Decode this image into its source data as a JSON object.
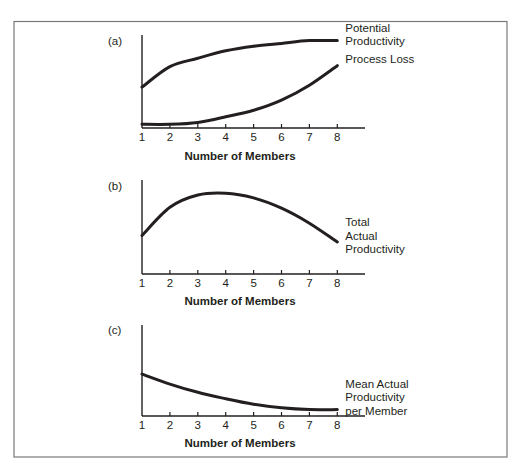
{
  "figure": {
    "frame_color": "#7a7a7a",
    "line_color": "#231f20",
    "background": "#ffffff"
  },
  "chart_data": [
    {
      "type": "line",
      "panel": "(a)",
      "title": "",
      "xlabel": "Number of Members",
      "ylabel": "",
      "x": [
        1,
        2,
        3,
        4,
        5,
        6,
        7,
        8
      ],
      "xticks": [
        "1",
        "2",
        "3",
        "4",
        "5",
        "6",
        "7",
        "8"
      ],
      "ylim": [
        0,
        100
      ],
      "grid": false,
      "legend_position": "inline-right",
      "series": [
        {
          "name": "Potential Productivity",
          "label_lines": [
            "Potential",
            "Productivity"
          ],
          "values": [
            44,
            66,
            75,
            83,
            88,
            91,
            94,
            94
          ]
        },
        {
          "name": "Process Loss",
          "label_lines": [
            "Process Loss"
          ],
          "values": [
            4,
            4,
            6,
            12,
            19,
            30,
            46,
            67
          ]
        }
      ]
    },
    {
      "type": "line",
      "panel": "(b)",
      "title": "",
      "xlabel": "Number of Members",
      "ylabel": "",
      "x": [
        1,
        2,
        3,
        4,
        5,
        6,
        7,
        8
      ],
      "xticks": [
        "1",
        "2",
        "3",
        "4",
        "5",
        "6",
        "7",
        "8"
      ],
      "ylim": [
        0,
        100
      ],
      "grid": false,
      "legend_position": "inline-right",
      "series": [
        {
          "name": "Total Actual Productivity",
          "label_lines": [
            "Total",
            "Actual",
            "Productivity"
          ],
          "values": [
            41,
            71,
            84,
            86,
            81,
            70,
            54,
            34
          ]
        }
      ]
    },
    {
      "type": "line",
      "panel": "(c)",
      "title": "",
      "xlabel": "Number of Members",
      "ylabel": "",
      "x": [
        1,
        2,
        3,
        4,
        5,
        6,
        7,
        8
      ],
      "xticks": [
        "1",
        "2",
        "3",
        "4",
        "5",
        "6",
        "7",
        "8"
      ],
      "ylim": [
        0,
        100
      ],
      "grid": false,
      "legend_position": "inline-right",
      "series": [
        {
          "name": "Mean Actual Productivity per Member",
          "label_lines": [
            "Mean Actual",
            "Productivity",
            "per Member"
          ],
          "values": [
            46,
            35,
            26,
            19,
            13,
            9,
            7,
            7
          ]
        }
      ]
    }
  ]
}
